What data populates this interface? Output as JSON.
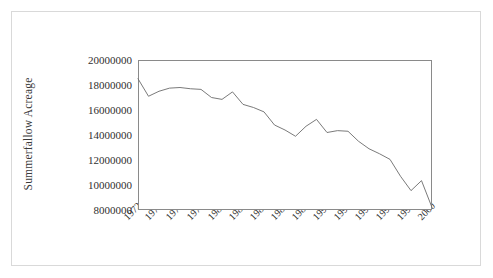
{
  "chart_data": {
    "type": "line",
    "title": "",
    "xlabel": "",
    "ylabel": "Summerfallow Acreage",
    "xlim": [
      1972,
      2000
    ],
    "ylim": [
      8000000,
      20000000
    ],
    "grid": false,
    "legend": "none",
    "x_tick_labels": [
      "1972",
      "1974",
      "1976",
      "1978",
      "1980",
      "1982",
      "1984",
      "1986",
      "1988",
      "1990",
      "1992",
      "1994",
      "1996",
      "1998",
      "2000"
    ],
    "y_tick_labels": [
      "20000000",
      "18000000",
      "16000000",
      "14000000",
      "12000000",
      "10000000",
      "8000000"
    ],
    "y_tick_values": [
      20000000,
      18000000,
      16000000,
      14000000,
      12000000,
      10000000,
      8000000
    ],
    "x": [
      1972,
      1973,
      1974,
      1975,
      1976,
      1977,
      1978,
      1979,
      1980,
      1981,
      1982,
      1983,
      1984,
      1985,
      1986,
      1987,
      1988,
      1989,
      1990,
      1991,
      1992,
      1993,
      1994,
      1995,
      1996,
      1997,
      1998,
      1999,
      2000
    ],
    "series": [
      {
        "name": "Summerfallow Acreage",
        "color": "#6b6b6b",
        "values": [
          18500000,
          17100000,
          17500000,
          17750000,
          17800000,
          17700000,
          17650000,
          17000000,
          16850000,
          17450000,
          16450000,
          16200000,
          15850000,
          14800000,
          14400000,
          13900000,
          14700000,
          15250000,
          14200000,
          14350000,
          14300000,
          13500000,
          12900000,
          12500000,
          12050000,
          10700000,
          9550000,
          10350000,
          8200000
        ]
      }
    ]
  },
  "axis": {
    "y_title": "Summerfallow Acreage"
  }
}
